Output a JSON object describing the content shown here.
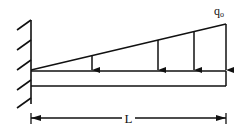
{
  "diagram": {
    "load_label": "q",
    "load_label_subscript": "o",
    "length_label": "L",
    "stroke_color": "#111111",
    "background": "#ffffff",
    "support": "fixed-wall",
    "load_type": "triangular distributed load, zero at wall increasing to q_o at free end",
    "load_arrow_count": 4
  }
}
